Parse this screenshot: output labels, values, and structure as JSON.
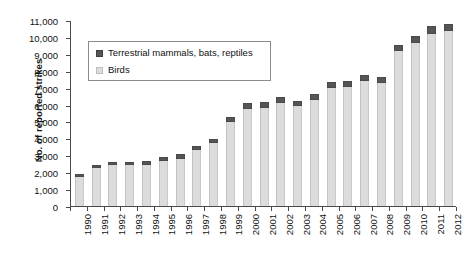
{
  "chart_data": {
    "type": "bar",
    "stacked": true,
    "title": "",
    "xlabel": "",
    "ylabel": "No. of reported strikes",
    "ylim": [
      0,
      11000
    ],
    "ytick_step": 1000,
    "grid": false,
    "legend_position": "top-left-inside",
    "categories": [
      "1990",
      "1991",
      "1992",
      "1993",
      "1994",
      "1995",
      "1996",
      "1997",
      "1998",
      "1999",
      "2000",
      "2001",
      "2002",
      "2003",
      "2004",
      "2005",
      "2006",
      "2007",
      "2008",
      "2009",
      "2010",
      "2011",
      "2012"
    ],
    "yticks": [
      "0",
      "1,000",
      "2,000",
      "3,000",
      "4,000",
      "5,000",
      "6,000",
      "7,000",
      "8,000",
      "9,000",
      "10,000",
      "11,000"
    ],
    "ytick_values": [
      0,
      1000,
      2000,
      3000,
      4000,
      5000,
      6000,
      7000,
      8000,
      9000,
      10000,
      11000
    ],
    "series": [
      {
        "name": "Birds",
        "color": "#dcdcdc",
        "values": [
          1700,
          2250,
          2400,
          2400,
          2450,
          2650,
          2800,
          3300,
          3700,
          4950,
          5750,
          5800,
          6100,
          5900,
          6250,
          6950,
          7050,
          7400,
          7250,
          9150,
          9650,
          10200,
          10350
        ]
      },
      {
        "name": "Terrestrial mammals, bats, reptiles",
        "color": "#555555",
        "values": [
          180,
          200,
          220,
          220,
          230,
          240,
          250,
          270,
          280,
          300,
          320,
          330,
          340,
          330,
          350,
          360,
          360,
          370,
          380,
          400,
          410,
          420,
          430
        ]
      }
    ],
    "totals": [
      1880,
      2450,
      2620,
      2620,
      2680,
      2890,
      3050,
      3570,
      3980,
      5250,
      6070,
      6130,
      6440,
      6230,
      6600,
      7310,
      7410,
      7770,
      7630,
      9550,
      10060,
      10620,
      10780
    ],
    "legend": [
      {
        "label": "Terrestrial mammals, bats, reptiles",
        "swatch": "dark"
      },
      {
        "label": "Birds",
        "swatch": "light"
      }
    ]
  }
}
